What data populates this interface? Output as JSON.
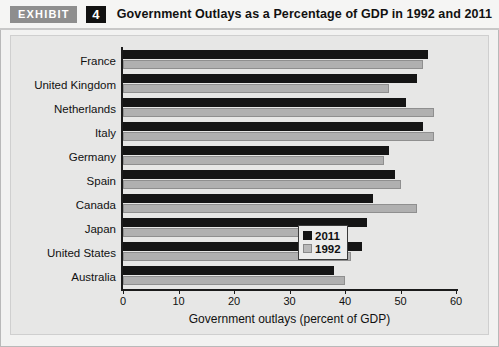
{
  "header": {
    "exhibit_tag": "EXHIBIT",
    "exhibit_number": "4",
    "title": "Government Outlays as a Percentage of GDP in 1992 and 2011"
  },
  "chart_data": {
    "type": "bar",
    "orientation": "horizontal",
    "title": "Government Outlays as a Percentage of GDP in 1992 and 2011",
    "xlabel": "Government outlays (percent of GDP)",
    "ylabel": "",
    "xlim": [
      0,
      60
    ],
    "xticks": [
      0,
      10,
      20,
      30,
      40,
      50,
      60
    ],
    "grid": false,
    "legend_position": "inside-right-lower",
    "categories": [
      "France",
      "United Kingdom",
      "Netherlands",
      "Italy",
      "Germany",
      "Spain",
      "Canada",
      "Japan",
      "United States",
      "Australia"
    ],
    "series": [
      {
        "name": "2011",
        "color": "#151515",
        "values": [
          55,
          53,
          51,
          54,
          48,
          49,
          45,
          44,
          43,
          38
        ]
      },
      {
        "name": "1992",
        "color": "#b0b0b0",
        "values": [
          54,
          48,
          56,
          56,
          47,
          50,
          53,
          34,
          41,
          40
        ]
      }
    ]
  }
}
